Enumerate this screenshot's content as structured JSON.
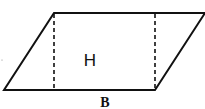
{
  "diagram": {
    "type": "parallelogram",
    "labels": {
      "height": "H",
      "base": "B"
    },
    "colors": {
      "stroke": "#111111",
      "background": "#ffffff"
    }
  }
}
